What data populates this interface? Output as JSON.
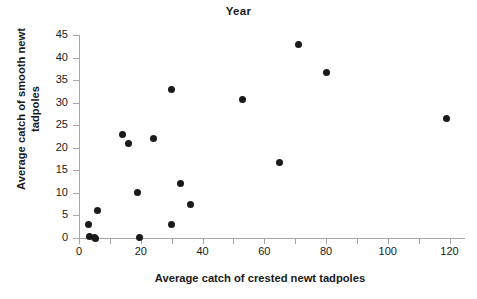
{
  "chart_data": {
    "type": "scatter",
    "title": "Year",
    "xlabel": "Average catch of crested newt tadpoles",
    "ylabel": "Average catch of smooth newt\ntadpoles",
    "ylabel_lines": [
      "Average catch of smooth newt",
      "tadpoles"
    ],
    "xlim": [
      0,
      125
    ],
    "ylim": [
      0,
      45
    ],
    "xticks": [
      0,
      20,
      40,
      60,
      80,
      100,
      120
    ],
    "xticks_minor": [
      10,
      30,
      50,
      70,
      90,
      110
    ],
    "yticks": [
      0,
      5,
      10,
      15,
      20,
      25,
      30,
      35,
      40,
      45
    ],
    "xtick_labels": [
      "0",
      "20",
      "40",
      "60",
      "80",
      "100",
      "120"
    ],
    "ytick_labels": [
      "0",
      "5",
      "10",
      "15",
      "20",
      "25",
      "30",
      "35",
      "40",
      "45"
    ],
    "grid": false,
    "legend": false,
    "marker": "filled-circle",
    "marker_color": "#1a1a1a",
    "axis_color": "#a6a6a6",
    "points": [
      {
        "x": 3,
        "y": 3
      },
      {
        "x": 3.5,
        "y": 0.4
      },
      {
        "x": 5,
        "y": 0.2
      },
      {
        "x": 5.5,
        "y": 0
      },
      {
        "x": 6,
        "y": 6
      },
      {
        "x": 14,
        "y": 23
      },
      {
        "x": 16,
        "y": 21
      },
      {
        "x": 19,
        "y": 10
      },
      {
        "x": 19.5,
        "y": 0.2
      },
      {
        "x": 24,
        "y": 22
      },
      {
        "x": 30,
        "y": 33
      },
      {
        "x": 30,
        "y": 3
      },
      {
        "x": 33,
        "y": 12
      },
      {
        "x": 36,
        "y": 7.5
      },
      {
        "x": 53,
        "y": 30.8
      },
      {
        "x": 65,
        "y": 16.8
      },
      {
        "x": 71,
        "y": 42.8
      },
      {
        "x": 80,
        "y": 36.7
      },
      {
        "x": 119,
        "y": 26.6
      }
    ]
  }
}
